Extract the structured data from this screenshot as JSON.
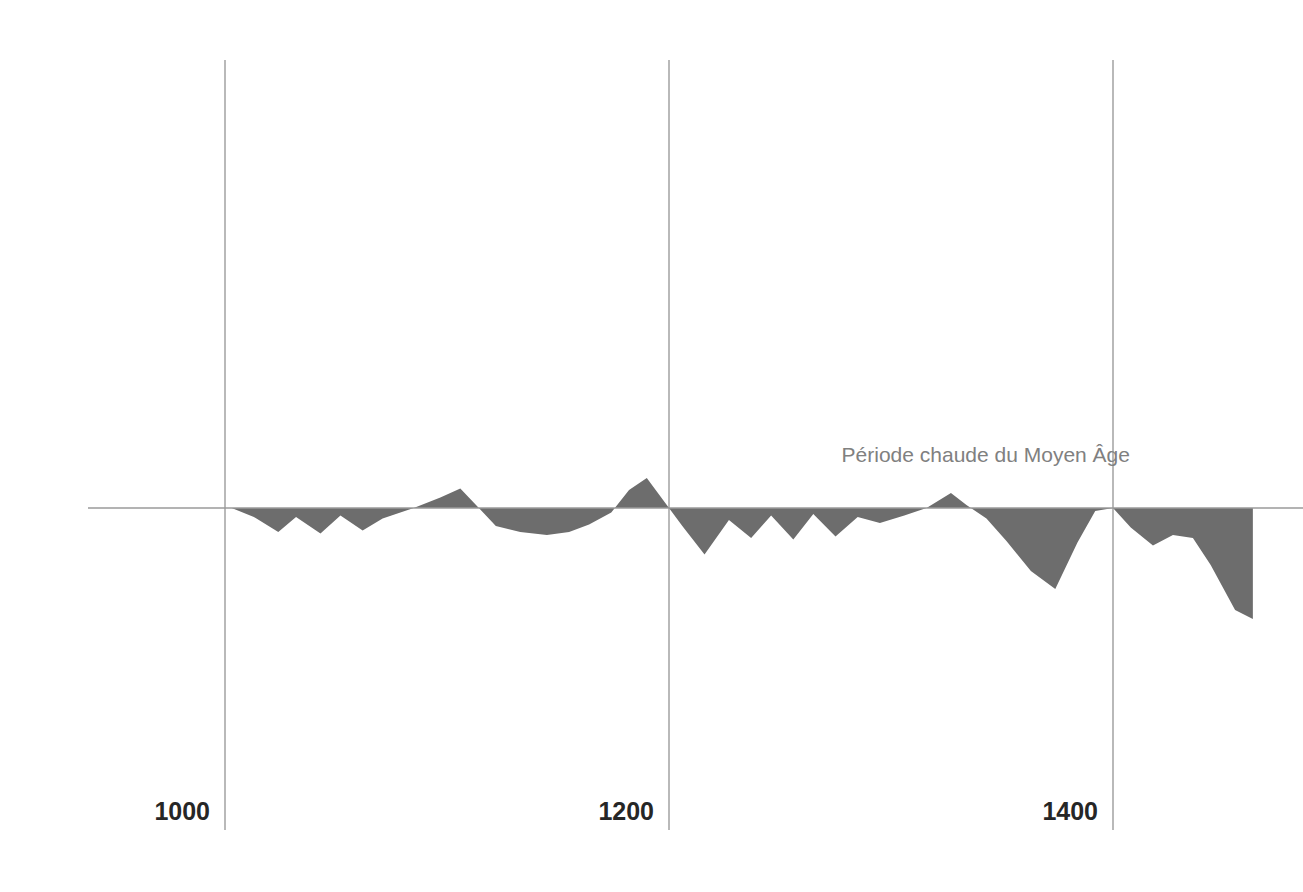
{
  "chart_data": {
    "type": "area",
    "title": "",
    "subtitle": "",
    "xlabel": "",
    "ylabel": "",
    "grid": true,
    "legend_position": "none",
    "xlim": [
      940,
      1465
    ],
    "ylim": [
      -1.1,
      0.45
    ],
    "baseline_value": 0,
    "fill_color": "#6d6d6d",
    "axis_color": "#9a9a9a",
    "gridline_color": "#a8a8a8",
    "x_ticks": [
      {
        "value": 1000,
        "label": "1000"
      },
      {
        "value": 1200,
        "label": "1200"
      },
      {
        "value": 1400,
        "label": "1400"
      }
    ],
    "annotations": [
      {
        "text": "Période chaude du Moyen Âge",
        "x": 1330,
        "y": 0.34,
        "color": "#808080"
      }
    ],
    "series": [
      {
        "name": "Anomalie de température",
        "x": [
          940,
          1003,
          1013,
          1024,
          1032,
          1043,
          1052,
          1062,
          1071,
          1085,
          1097,
          1106,
          1115,
          1122,
          1133,
          1145,
          1155,
          1164,
          1174,
          1182,
          1190,
          1200,
          1206,
          1216,
          1227,
          1237,
          1246,
          1256,
          1265,
          1275,
          1285,
          1295,
          1306,
          1316,
          1327,
          1334,
          1343,
          1352,
          1363,
          1374,
          1384,
          1392,
          1400,
          1408,
          1418,
          1427,
          1436,
          1444,
          1455,
          1463
        ],
        "y": [
          0.0,
          0.0,
          -0.06,
          -0.16,
          -0.06,
          -0.17,
          -0.05,
          -0.15,
          -0.07,
          0.0,
          0.07,
          0.13,
          -0.01,
          -0.12,
          -0.16,
          -0.18,
          -0.16,
          -0.11,
          -0.03,
          0.12,
          0.2,
          0.0,
          -0.12,
          -0.31,
          -0.08,
          -0.2,
          -0.05,
          -0.21,
          -0.04,
          -0.19,
          -0.06,
          -0.1,
          -0.05,
          0.0,
          0.1,
          0.02,
          -0.07,
          -0.22,
          -0.42,
          -0.54,
          -0.23,
          -0.02,
          0.0,
          -0.13,
          -0.25,
          -0.18,
          -0.2,
          -0.38,
          -0.68,
          -0.74
        ]
      }
    ]
  },
  "geometry": {
    "width": 1303,
    "height": 892,
    "baseline_y": 508,
    "plot_left": 88,
    "plot_right": 1303,
    "grid_top": 60,
    "grid_bottom": 830,
    "px_per_year": 2.22,
    "x_origin_year": 1000,
    "x_origin_px": 225,
    "y_unit_px": 150
  }
}
